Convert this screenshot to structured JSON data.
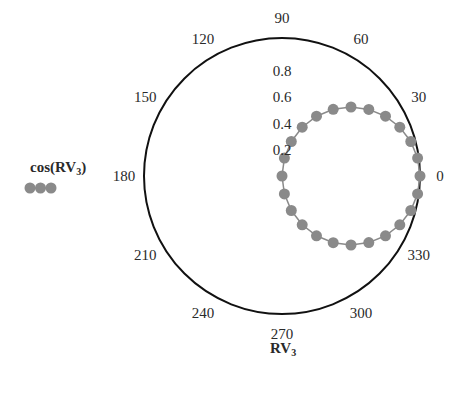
{
  "chart_data": {
    "type": "polar-line",
    "title": "",
    "xlabel": "RV3",
    "xlabel_main": "RV",
    "xlabel_sub": "3",
    "legend": {
      "entries": [
        {
          "label": "cos(RV3)",
          "label_prefix": "cos(",
          "label_main": "RV",
          "label_sub": "3",
          "label_suffix": ")",
          "marker": "circle",
          "color": "#8a8a8a"
        }
      ],
      "position": "left"
    },
    "angular_ticks": [
      "0",
      "30",
      "60",
      "90",
      "120",
      "150",
      "180",
      "210",
      "240",
      "270",
      "300",
      "330"
    ],
    "radial_ticks": [
      "0.2",
      "0.4",
      "0.6",
      "0.8"
    ],
    "rlim": [
      0,
      1
    ],
    "grid": false,
    "series": [
      {
        "name": "cos(RV3)",
        "theta_deg": [
          0,
          7.5,
          15,
          22.5,
          30,
          37.5,
          45,
          52.5,
          60,
          67.5,
          75,
          82.5,
          90,
          97.5,
          105,
          112.5,
          120,
          127.5,
          135,
          142.5,
          150,
          157.5,
          165,
          172.5
        ],
        "r": [
          1.0,
          0.991,
          0.966,
          0.924,
          0.866,
          0.793,
          0.707,
          0.609,
          0.5,
          0.383,
          0.259,
          0.131,
          0.0,
          -0.131,
          -0.259,
          -0.383,
          -0.5,
          -0.609,
          -0.707,
          -0.793,
          -0.866,
          -0.924,
          -0.966,
          -0.991
        ]
      }
    ]
  },
  "colors": {
    "axis": "#111111",
    "marker": "#8a8a8a",
    "line": "#8a8a8a",
    "text": "#2a2a2a"
  }
}
